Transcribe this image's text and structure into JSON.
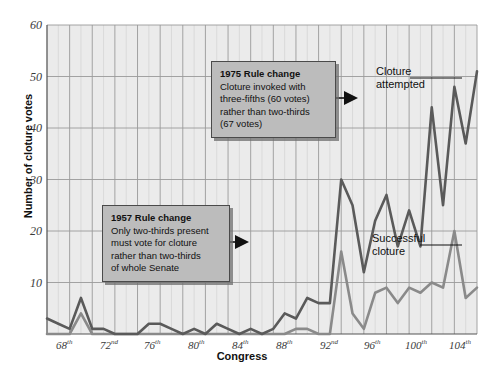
{
  "chart_data": {
    "type": "line",
    "title": "",
    "xlabel": "Congress",
    "ylabel": "Number of cloture votes",
    "ylim": [
      0,
      60
    ],
    "yticks": [
      10,
      20,
      30,
      40,
      50,
      60
    ],
    "grid": true,
    "legend_position": "inline-annotation",
    "x": [
      "66th",
      "67th",
      "68th",
      "69th",
      "70th",
      "71st",
      "72nd",
      "73rd",
      "74th",
      "75th",
      "76th",
      "77th",
      "78th",
      "79th",
      "80th",
      "81st",
      "82nd",
      "83rd",
      "84th",
      "85th",
      "86th",
      "87th",
      "88th",
      "89th",
      "90th",
      "91st",
      "92nd",
      "93rd",
      "94th",
      "95th",
      "96th",
      "97th",
      "98th",
      "99th",
      "100th",
      "101st",
      "102nd",
      "103rd",
      "104th"
    ],
    "xtick_labels": [
      "68th",
      "72nd",
      "76th",
      "80th",
      "84th",
      "88th",
      "92nd",
      "96th",
      "100th",
      "104th"
    ],
    "series": [
      {
        "name": "Cloture attempted",
        "color": "#5a5a5a",
        "values": [
          3,
          2,
          1,
          7,
          1,
          1,
          0,
          0,
          0,
          2,
          2,
          1,
          0,
          1,
          0,
          2,
          1,
          0,
          1,
          0,
          1,
          4,
          3,
          7,
          6,
          6,
          30,
          25,
          12,
          22,
          27,
          17,
          24,
          17,
          44,
          25,
          48,
          37,
          51
        ]
      },
      {
        "name": "Successful cloture",
        "color": "#8a8a8a",
        "values": [
          0,
          0,
          0,
          4,
          0,
          0,
          0,
          0,
          0,
          0,
          0,
          0,
          0,
          0,
          0,
          0,
          0,
          0,
          0,
          0,
          0,
          0,
          1,
          1,
          0,
          0,
          16,
          4,
          1,
          8,
          9,
          6,
          9,
          8,
          10,
          9,
          20,
          7,
          9
        ]
      }
    ],
    "annotations": [
      {
        "id": "rule-change-1975",
        "heading": "1975 Rule change",
        "lines": [
          "Cloture invoked with",
          "three-fifths (60 votes)",
          "rather than two-thirds",
          "(67 votes)"
        ],
        "arrow_direction": "right"
      },
      {
        "id": "rule-change-1957",
        "heading": "1957 Rule change",
        "lines": [
          "Only two-thirds present",
          "must vote for cloture",
          "rather than two-thirds",
          "of whole Senate"
        ],
        "arrow_direction": "right"
      }
    ],
    "series_callouts": [
      {
        "id": "cloture-attempted-label",
        "lines": [
          "Cloture",
          "attempted"
        ]
      },
      {
        "id": "successful-cloture-label",
        "lines": [
          "Successful",
          "cloture"
        ]
      }
    ],
    "colors": {
      "plot_background": "#ebebeb",
      "gridline": "#d2d2d2",
      "gridline_major": "#9a9a9a",
      "axis": "#555555",
      "callout_fill": "#bcbcbc",
      "callout_border": "#4a4a4a",
      "text": "#111111"
    }
  }
}
